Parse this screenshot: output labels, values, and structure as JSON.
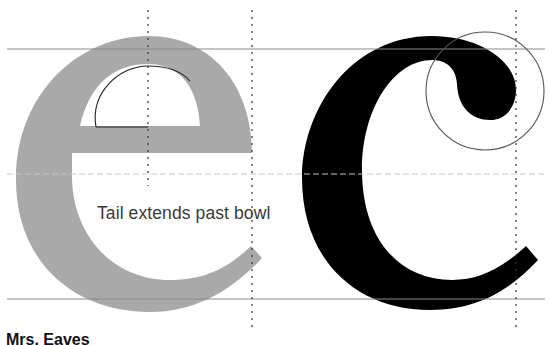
{
  "diagram": {
    "caption": "Tail extends past bowl",
    "font_name": "Mrs. Eaves",
    "glyphs": [
      {
        "char": "e",
        "fill": "#a9a9a9",
        "role": "comparison glyph"
      },
      {
        "char": "c",
        "fill": "#000000",
        "role": "featured glyph"
      }
    ],
    "colors": {
      "guide_line": "#8a8a8a",
      "faint_guide": "#c8c8c8",
      "dotted_guide": "#333333",
      "highlight_circle": "#555555",
      "counter_outline": "#222222"
    },
    "guides": {
      "horizontal": [
        {
          "name": "x-height",
          "y": 49
        },
        {
          "name": "mid",
          "y": 174
        },
        {
          "name": "baseline",
          "y": 299
        }
      ],
      "vertical_dotted": [
        {
          "name": "e-center",
          "x": 148
        },
        {
          "name": "e-right",
          "x": 252
        },
        {
          "name": "c-right",
          "x": 516
        }
      ]
    },
    "highlight_circle": {
      "cx": 485,
      "cy": 91,
      "r": 59
    }
  }
}
